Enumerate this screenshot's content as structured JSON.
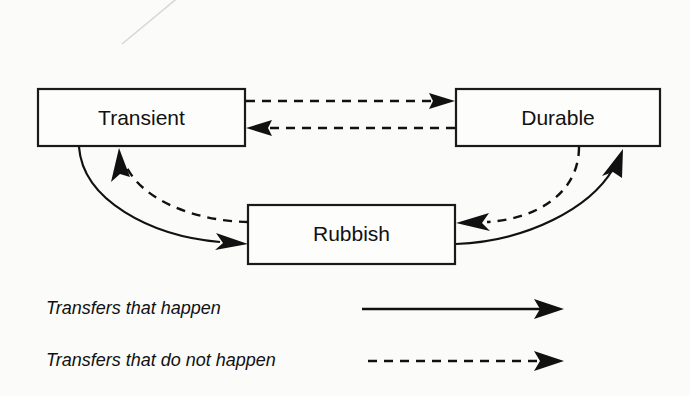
{
  "diagram": {
    "background_color": "#fbfbfa",
    "stroke_color": "#111111",
    "nodes": [
      {
        "id": "transient",
        "label": "Transient",
        "x": 38,
        "y": 89,
        "w": 207,
        "h": 57
      },
      {
        "id": "durable",
        "label": "Durable",
        "x": 456,
        "y": 89,
        "w": 204,
        "h": 57
      },
      {
        "id": "rubbish",
        "label": "Rubbish",
        "x": 248,
        "y": 205,
        "w": 207,
        "h": 59
      }
    ],
    "edges": [
      {
        "id": "transient-to-durable",
        "from": "Transient",
        "to": "Durable",
        "style": "dashed",
        "meaning": "Transfers that do not happen"
      },
      {
        "id": "durable-to-transient",
        "from": "Durable",
        "to": "Transient",
        "style": "dashed",
        "meaning": "Transfers that do not happen"
      },
      {
        "id": "transient-to-rubbish",
        "from": "Transient",
        "to": "Rubbish",
        "style": "solid",
        "meaning": "Transfers that happen"
      },
      {
        "id": "rubbish-to-transient",
        "from": "Rubbish",
        "to": "Transient",
        "style": "dashed",
        "meaning": "Transfers that do not happen"
      },
      {
        "id": "rubbish-to-durable",
        "from": "Rubbish",
        "to": "Durable",
        "style": "solid",
        "meaning": "Transfers that happen"
      },
      {
        "id": "durable-to-rubbish",
        "from": "Durable",
        "to": "Rubbish",
        "style": "dashed",
        "meaning": "Transfers that do not happen"
      }
    ],
    "legend": [
      {
        "id": "legend-happen",
        "label": "Transfers that happen",
        "style": "solid"
      },
      {
        "id": "legend-not-happen",
        "label": "Transfers that do not happen",
        "style": "dashed"
      }
    ]
  }
}
